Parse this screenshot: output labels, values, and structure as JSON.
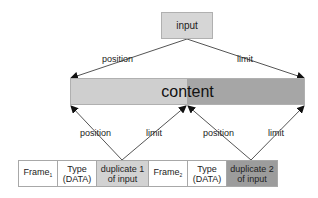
{
  "diagram": {
    "input_label": "input",
    "content_label": "content",
    "top_arrows": {
      "left_label": "position",
      "right_label": "limit"
    },
    "bottom_arrows": [
      {
        "left_label": "position",
        "right_label": "limit"
      },
      {
        "left_label": "position",
        "right_label": "limit"
      }
    ],
    "frames": [
      {
        "name": "Frame",
        "sub": "1",
        "type_line1": "Type",
        "type_line2": "(DATA)",
        "dup_line1": "duplicate 1",
        "dup_line2": "of input"
      },
      {
        "name": "Frame",
        "sub": "2",
        "type_line1": "Type",
        "type_line2": "(DATA)",
        "dup_line1": "duplicate 2",
        "dup_line2": "of input"
      }
    ],
    "colors": {
      "input_fill": "#d6d6d6",
      "content_left_fill": "#cfcfcf",
      "content_right_fill": "#a6a6a6",
      "dup1_fill": "#d2d2d2",
      "dup2_fill": "#9c9c9c",
      "arrow": "#555555"
    }
  }
}
